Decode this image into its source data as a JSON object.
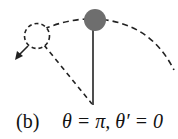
{
  "figure": {
    "panel_label": "(b)",
    "condition": "θ = π,  θ′ = 0",
    "elements": {
      "pendulum_bob": {
        "state": "inverted (top)",
        "fill": "#6e6e6e"
      },
      "ghost_bob": {
        "style": "dashed outline"
      },
      "rod": {
        "style": "solid"
      },
      "ghost_rod": {
        "style": "dashed"
      },
      "arc": {
        "style": "dashed"
      },
      "arrow": {
        "direction": "down-left"
      }
    }
  }
}
